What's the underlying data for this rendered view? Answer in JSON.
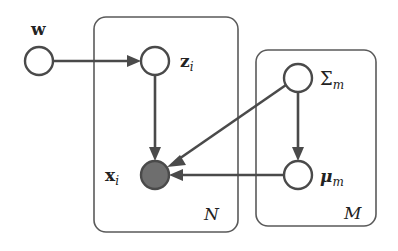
{
  "diagram": {
    "type": "probabilistic-graphical-model",
    "plates": [
      {
        "id": "plate-N",
        "label": "N"
      },
      {
        "id": "plate-M",
        "label": "M"
      }
    ],
    "nodes": [
      {
        "id": "w",
        "label": "w",
        "observed": false
      },
      {
        "id": "z_i",
        "label_main": "z",
        "label_sub": "i",
        "observed": false
      },
      {
        "id": "x_i",
        "label_main": "x",
        "label_sub": "i",
        "observed": true
      },
      {
        "id": "Sigma_m",
        "label_main": "Σ",
        "label_sub": "m",
        "observed": false
      },
      {
        "id": "mu_m",
        "label_main": "μ",
        "label_sub": "m",
        "observed": false
      }
    ],
    "edges": [
      {
        "from": "w",
        "to": "z_i"
      },
      {
        "from": "z_i",
        "to": "x_i"
      },
      {
        "from": "Sigma_m",
        "to": "x_i"
      },
      {
        "from": "Sigma_m",
        "to": "mu_m"
      },
      {
        "from": "mu_m",
        "to": "x_i"
      }
    ],
    "colors": {
      "stroke": "#4a4a4a",
      "observed_fill": "#6e6e6e",
      "background": "#ffffff"
    }
  }
}
